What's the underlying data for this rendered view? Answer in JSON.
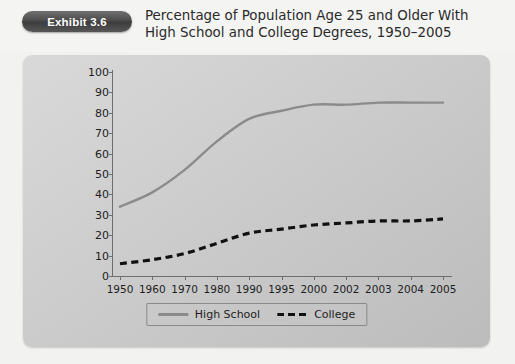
{
  "header": {
    "badge_label": "Exhibit 3.6",
    "title": "Percentage of Population Age 25 and Older With High School and College Degrees, 1950–2005"
  },
  "colors": {
    "high_school_line": "#8b8b8b",
    "college_line": "#111111",
    "axis": "#6e6e6e",
    "panel_background": "#cfcfcf",
    "badge_background": "#4a4a4a",
    "page_background": "#f2f2f1"
  },
  "chart_data": {
    "type": "line",
    "title": "Percentage of Population Age 25 and Older With High School and College Degrees, 1950–2005",
    "xlabel": "",
    "ylabel": "",
    "categories": [
      "1950",
      "1960",
      "1970",
      "1980",
      "1990",
      "1995",
      "2000",
      "2002",
      "2003",
      "2004",
      "2005"
    ],
    "series": [
      {
        "name": "High School",
        "style": "solid",
        "color": "#8b8b8b",
        "values": [
          34,
          41,
          52,
          66,
          77,
          81,
          84,
          84,
          85,
          85,
          85
        ]
      },
      {
        "name": "College",
        "style": "dashed",
        "color": "#111111",
        "values": [
          6,
          8,
          11,
          16,
          21,
          23,
          25,
          26,
          27,
          27,
          28
        ]
      }
    ],
    "ylim": [
      0,
      100
    ],
    "yticks": [
      0,
      10,
      20,
      30,
      40,
      50,
      60,
      70,
      80,
      90,
      100
    ],
    "ytick_labels": [
      "0",
      "10",
      "20",
      "30",
      "40",
      "50",
      "60",
      "70",
      "80",
      "90",
      "100"
    ],
    "grid": false,
    "legend_position": "bottom",
    "legend_entries": [
      "High School",
      "College"
    ]
  }
}
